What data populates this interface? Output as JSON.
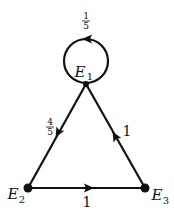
{
  "diagram": {
    "type": "state-transition-graph",
    "nodes": [
      {
        "id": "E1",
        "label": "E",
        "sub": "1",
        "x": 86,
        "y": 84
      },
      {
        "id": "E2",
        "label": "E",
        "sub": "2",
        "x": 28,
        "y": 188
      },
      {
        "id": "E3",
        "label": "E",
        "sub": "3",
        "x": 145,
        "y": 188
      }
    ],
    "edges": [
      {
        "from": "E1",
        "to": "E1",
        "weight": "1/5",
        "num": "1",
        "den": "5"
      },
      {
        "from": "E1",
        "to": "E2",
        "weight": "4/5",
        "num": "4",
        "den": "5"
      },
      {
        "from": "E3",
        "to": "E1",
        "weight": "1"
      },
      {
        "from": "E2",
        "to": "E3",
        "weight": "1"
      }
    ]
  },
  "labels": {
    "loop_num": "1",
    "loop_den": "5",
    "e1e2_num": "4",
    "e1e2_den": "5",
    "e3e1": "1",
    "e2e3": "1",
    "E1_main": "E",
    "E1_sub": "1",
    "E2_main": "E",
    "E2_sub": "2",
    "E3_main": "E",
    "E3_sub": "3"
  },
  "colors": {
    "stroke": "#111111",
    "background": "#ffffff"
  }
}
